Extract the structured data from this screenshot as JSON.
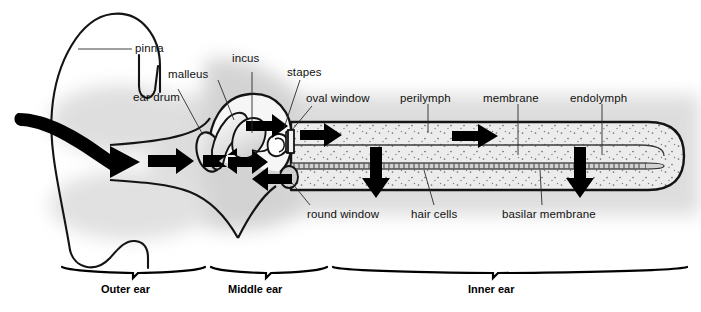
{
  "figure": {
    "colors": {
      "outline": "#111111",
      "fluid_fill": "#e8e8e8",
      "shadow": "#cfcfcf",
      "arrow": "#000000",
      "text": "#111111"
    }
  },
  "labels": {
    "pinna": "pinna",
    "ear_drum": "ear drum",
    "malleus": "malleus",
    "incus": "incus",
    "stapes": "stapes",
    "oval_window": "oval window",
    "round_window": "round window",
    "perilymph": "perilymph",
    "membrane": "membrane",
    "endolymph": "endolymph",
    "hair_cells": "hair cells",
    "basilar_membrane": "basilar membrane"
  },
  "regions": [
    {
      "id": "outer",
      "label": "Outer ear"
    },
    {
      "id": "middle",
      "label": "Middle ear"
    },
    {
      "id": "inner",
      "label": "Inner ear"
    }
  ],
  "flow_arrows": [
    {
      "id": "sound-wave-in",
      "direction": "right",
      "location": "ear canal entrance"
    },
    {
      "id": "canal-arrow-right",
      "direction": "right",
      "location": "ear canal"
    },
    {
      "id": "eardrum-arrow-left",
      "direction": "left",
      "location": "ear drum"
    },
    {
      "id": "ossicle-arrow-right-upper",
      "direction": "right",
      "location": "malleus-incus"
    },
    {
      "id": "ossicle-arrow-right-lower",
      "direction": "right",
      "location": "malleus base"
    },
    {
      "id": "round-window-arrow-left",
      "direction": "left",
      "location": "round window"
    },
    {
      "id": "cochlea-arrow-1",
      "direction": "right",
      "location": "scala vestibuli near oval window"
    },
    {
      "id": "cochlea-arrow-2",
      "direction": "right",
      "location": "scala vestibuli mid"
    },
    {
      "id": "cochlea-arrow-down-1",
      "direction": "down",
      "location": "through basilar membrane near base"
    },
    {
      "id": "cochlea-arrow-down-2",
      "direction": "down",
      "location": "through basilar membrane mid"
    }
  ]
}
